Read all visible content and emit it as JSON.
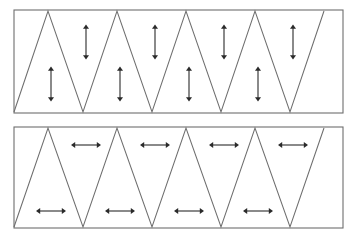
{
  "figure": {
    "width": 355,
    "height": 241,
    "background_color": "#ffffff",
    "line_color": "#6e6e6e",
    "arrow_color": "#2a2a2a"
  },
  "panels": [
    {
      "id": "top-panel",
      "name": "upper-zigzag-panel",
      "frame": {
        "x": 14,
        "y": 10,
        "width": 329,
        "height": 103
      },
      "zigzag": {
        "peak_y": 11,
        "valley_y": 112,
        "peaks_x": [
          48,
          117,
          186,
          255,
          324
        ],
        "valleys_x": [
          14,
          83,
          152,
          221,
          290
        ],
        "period": 69
      },
      "arrow_orientation": "vertical",
      "arrows": [
        {
          "name": "vertical-arrow-upper-1",
          "cx": 86,
          "cy": 42,
          "length": 35,
          "orientation": "vertical"
        },
        {
          "name": "vertical-arrow-upper-2",
          "cx": 155,
          "cy": 42,
          "length": 35,
          "orientation": "vertical"
        },
        {
          "name": "vertical-arrow-upper-3",
          "cx": 224,
          "cy": 42,
          "length": 35,
          "orientation": "vertical"
        },
        {
          "name": "vertical-arrow-upper-4",
          "cx": 293,
          "cy": 42,
          "length": 35,
          "orientation": "vertical"
        },
        {
          "name": "vertical-arrow-lower-1",
          "cx": 51,
          "cy": 84,
          "length": 35,
          "orientation": "vertical"
        },
        {
          "name": "vertical-arrow-lower-2",
          "cx": 120,
          "cy": 84,
          "length": 35,
          "orientation": "vertical"
        },
        {
          "name": "vertical-arrow-lower-3",
          "cx": 189,
          "cy": 84,
          "length": 35,
          "orientation": "vertical"
        },
        {
          "name": "vertical-arrow-lower-4",
          "cx": 258,
          "cy": 84,
          "length": 35,
          "orientation": "vertical"
        }
      ]
    },
    {
      "id": "bottom-panel",
      "name": "lower-zigzag-panel",
      "frame": {
        "x": 14,
        "y": 127,
        "width": 329,
        "height": 101
      },
      "zigzag": {
        "peak_y": 128,
        "valley_y": 227,
        "peaks_x": [
          48,
          117,
          186,
          255,
          324
        ],
        "valleys_x": [
          14,
          83,
          152,
          221,
          290
        ],
        "period": 69
      },
      "arrow_orientation": "horizontal",
      "arrows": [
        {
          "name": "horizontal-arrow-upper-1",
          "cx": 86,
          "cy": 145,
          "length": 30,
          "orientation": "horizontal"
        },
        {
          "name": "horizontal-arrow-upper-2",
          "cx": 155,
          "cy": 145,
          "length": 30,
          "orientation": "horizontal"
        },
        {
          "name": "horizontal-arrow-upper-3",
          "cx": 224,
          "cy": 145,
          "length": 30,
          "orientation": "horizontal"
        },
        {
          "name": "horizontal-arrow-upper-4",
          "cx": 293,
          "cy": 145,
          "length": 30,
          "orientation": "horizontal"
        },
        {
          "name": "horizontal-arrow-lower-1",
          "cx": 51,
          "cy": 211,
          "length": 30,
          "orientation": "horizontal"
        },
        {
          "name": "horizontal-arrow-lower-2",
          "cx": 120,
          "cy": 211,
          "length": 30,
          "orientation": "horizontal"
        },
        {
          "name": "horizontal-arrow-lower-3",
          "cx": 189,
          "cy": 211,
          "length": 30,
          "orientation": "horizontal"
        },
        {
          "name": "horizontal-arrow-lower-4",
          "cx": 258,
          "cy": 211,
          "length": 30,
          "orientation": "horizontal"
        }
      ]
    }
  ]
}
